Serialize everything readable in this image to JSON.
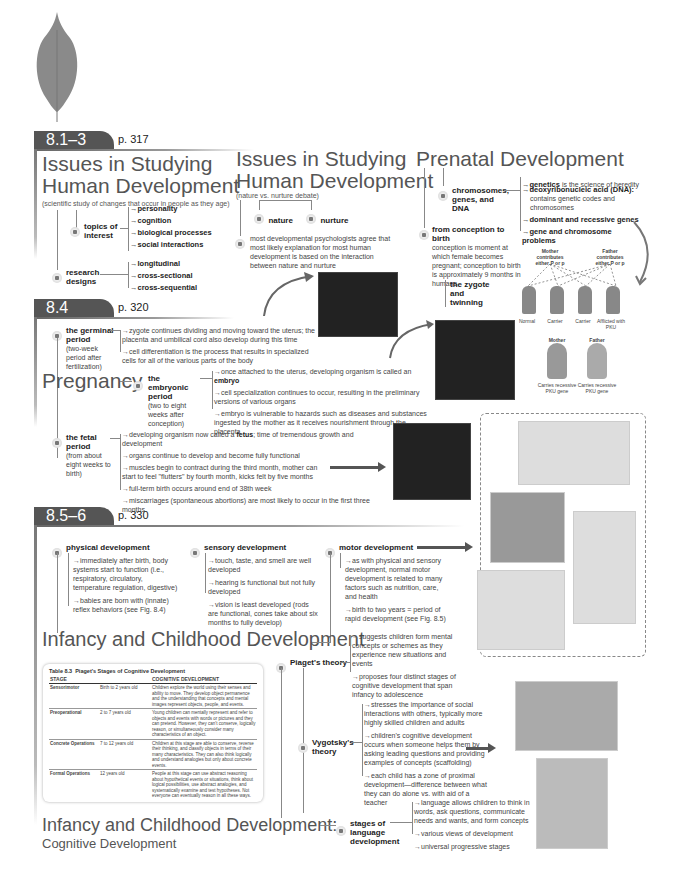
{
  "sections": {
    "s1": {
      "tab": "8.1–3",
      "page": "p. 317",
      "issues_a": {
        "title_line1": "Issues in Studying",
        "title_line2": "Human Development",
        "subtitle": "(scientific study of changes that occur in people as they age)",
        "topics_label": "topics of interest",
        "topics": [
          "personality",
          "cognition",
          "biological processes",
          "social interactions"
        ],
        "designs_label": "research designs",
        "designs": [
          "longitudinal",
          "cross-sectional",
          "cross-sequential"
        ]
      },
      "issues_b": {
        "title_line1": "Issues in Studying",
        "title_line2": "Human Development",
        "subtitle": "(nature vs. nurture debate)",
        "nature": "nature",
        "nurture": "nurture",
        "consensus": "most developmental psychologists agree that most likely explanation for most human development is based on the interaction between nature and nurture"
      },
      "prenatal": {
        "title": "Prenatal Development",
        "chromosomes_label": "chromosomes, genes, and DNA",
        "genetics_bold": "genetics",
        "genetics_rest": " is the science of heredity",
        "dna_bold": "deoxyribonucleic acid (DNA):",
        "dna_rest": "contains genetic codes and chromosomes",
        "dominant": "dominant and recessive genes",
        "problems": "gene and chromosome problems",
        "conception_label": "from conception to birth",
        "conception_text": "conception is moment at which female becomes pregnant; conception to birth is approximately 9 months in humans",
        "zygote": "the zygote and twinning",
        "mother_contrib": "Mother contributes either P or p",
        "father_contrib": "Father contributes either P or p",
        "children": [
          "Normal",
          "Carrier",
          "Carrier",
          "Afflicted with PKU"
        ],
        "mother": "Mother",
        "father": "Father",
        "mother_caption": "Carries recessive PKU gene",
        "father_caption": "Carries recessive PKU gene"
      }
    },
    "s2": {
      "tab": "8.4",
      "page": "p. 320",
      "title": "Pregnancy",
      "germinal": {
        "label": "the germinal period",
        "note": "(two-week period after fertilization)",
        "items": [
          "zygote continues dividing and moving toward the uterus; the placenta and umbilical cord also develop during this time",
          "cell differentiation is the process that results in specialized cells for all of the various parts of the body"
        ]
      },
      "embryonic": {
        "label": "the embryonic period",
        "note": "(two to eight weeks after conception)",
        "item1_pre": "once attached to the uterus, developing organism is called an ",
        "item1_bold": "embryo",
        "items": [
          "cell specialization continues to occur, resulting in the preliminary versions of various organs",
          "embryo is vulnerable to hazards such as diseases and substances ingested by the mother as it receives nourishment through the placenta"
        ]
      },
      "fetal": {
        "label": "the fetal period",
        "note": "(from about eight weeks to birth)",
        "item1_pre": "developing organism now called a ",
        "item1_bold": "fetus",
        "item1_post": "; time of tremendous growth and development",
        "items": [
          "organs continue to develop and become fully functional",
          "muscles begin to contract during the third month, mother can start to feel \"flutters\" by fourth month, kicks felt by five months",
          "full-term birth occurs around end of 38th week",
          "miscarriages (spontaneous abortions) are most likely to occur in the first three months"
        ]
      }
    },
    "s3": {
      "tab": "8.5–6",
      "page": "p. 330",
      "physical": {
        "label": "physical development",
        "items": [
          "immediately after birth, body systems start to function (i.e., respiratory, circulatory, temperature regulation, digestive)",
          "babies are born with (innate) reflex behaviors (see Fig. 8.4)"
        ]
      },
      "sensory": {
        "label": "sensory development",
        "items": [
          "touch, taste, and smell are well developed",
          "hearing is functional but not fully developed",
          "vision is least developed (rods are functional, cones take about six months to fully develop)"
        ]
      },
      "motor": {
        "label": "motor development",
        "items": [
          "as with physical and sensory development, normal motor development is related to many factors such as nutrition, care, and health",
          "birth to two years = period of rapid development (see Fig. 8.5)"
        ]
      },
      "title1": "Infancy and Childhood Development",
      "piaget": {
        "label": "Piaget's theory",
        "items": [
          "suggests children form mental concepts or schemes as they experience new situations and events",
          "proposes four distinct stages of cognitive development that span infancy to adolescence"
        ]
      },
      "vygotsky": {
        "label": "Vygotsky's theory",
        "items": [
          "stresses the importance of social interactions with others, typically more highly skilled children and adults",
          "children's cognitive development occurs when someone helps them by asking leading questions and providing examples of concepts (scaffolding)",
          "each child has a zone of proximal development—difference between what they can do alone vs. with aid of a teacher"
        ]
      },
      "language": {
        "label": "stages of language development",
        "items": [
          "language allows children to think in words, ask questions, communicate needs and wants, and form concepts",
          "various views of development",
          "universal progressive stages"
        ]
      },
      "title2_line1": "Infancy and Childhood Development:",
      "title2_line2": "Cognitive Development",
      "table": {
        "caption_num": "Table 8.3",
        "caption": "Piaget's Stages of Cognitive Development",
        "headers": [
          "STAGE",
          "",
          "COGNITIVE DEVELOPMENT"
        ],
        "rows": [
          {
            "stage": "Sensorimotor",
            "age": "Birth to 2 years old",
            "desc": "Children explore the world using their senses and ability to move. They develop object permanence and the understanding that concepts and mental images represent objects, people, and events."
          },
          {
            "stage": "Preoperational",
            "age": "2 to 7 years old",
            "desc": "Young children can mentally represent and refer to objects and events with words or pictures and they can pretend. However, they can't conserve, logically reason, or simultaneously consider many characteristics of an object."
          },
          {
            "stage": "Concrete Operations",
            "age": "7 to 12 years old",
            "desc": "Children at this stage are able to conserve, reverse their thinking, and classify objects in terms of their many characteristics. They can also think logically and understand analogies but only about concrete events."
          },
          {
            "stage": "Formal Operations",
            "age": "12 years old",
            "desc": "People at this stage can use abstract reasoning about hypothetical events or situations, think about logical possibilities, use abstract analogies, and systematically examine and test hypotheses. Not everyone can eventually reason in all these ways."
          }
        ]
      }
    }
  }
}
